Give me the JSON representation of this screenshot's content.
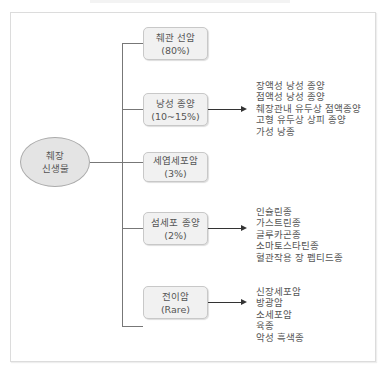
{
  "diagram": {
    "root": {
      "line1": "췌장",
      "line2": "신생물"
    },
    "branches": [
      {
        "name": "췌관 선암",
        "share": "(80%)",
        "subtypes": []
      },
      {
        "name": "낭성 종양",
        "share": "(10~15%)",
        "subtypes": [
          "장액성 낭성 종양",
          "점액성 낭성 종양",
          "췌장관내 유두상 점액종양",
          "고형 유두상 상피 종양",
          "가성 낭종"
        ]
      },
      {
        "name": "세엽세포암",
        "share": "(3%)",
        "subtypes": []
      },
      {
        "name": "섬세포 종양",
        "share": "(2%)",
        "subtypes": [
          "인슐린종",
          "가스트린종",
          "글루카곤종",
          "소마토스타틴종",
          "혈관작용 장 펩티드종"
        ]
      },
      {
        "name": "전이암",
        "share": "(Rare)",
        "subtypes": [
          "신장세포암",
          "방광암",
          "소세포암",
          "육종",
          "악성 흑색종"
        ]
      }
    ]
  },
  "colors": {
    "node_fill": "#f1f1f1",
    "root_fill": "#e4e4e4",
    "line": "#777777",
    "arrow": "#333333",
    "text": "#555555"
  }
}
